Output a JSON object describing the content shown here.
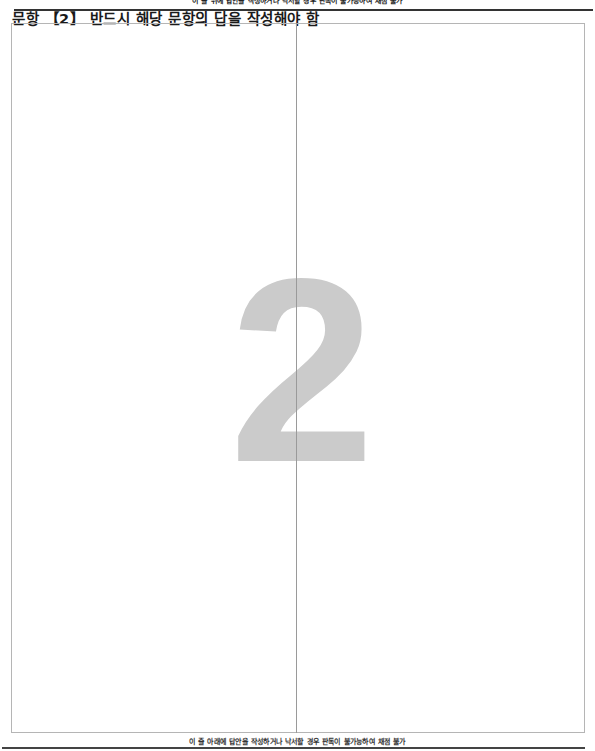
{
  "header": {
    "top_note": "이 줄 위에 답안을 작성하거나 낙서할 경우 판독이 불가능하여 채점 불가",
    "title": "문항 【2】 반드시 해당 문항의 답을 작성해야 함"
  },
  "answer_area": {
    "question_number": "2",
    "columns": 2
  },
  "footer": {
    "bottom_note": "이 줄 아래에 답안을 작성하거나 낙서할 경우 판독이 불가능하여 채점 불가"
  }
}
